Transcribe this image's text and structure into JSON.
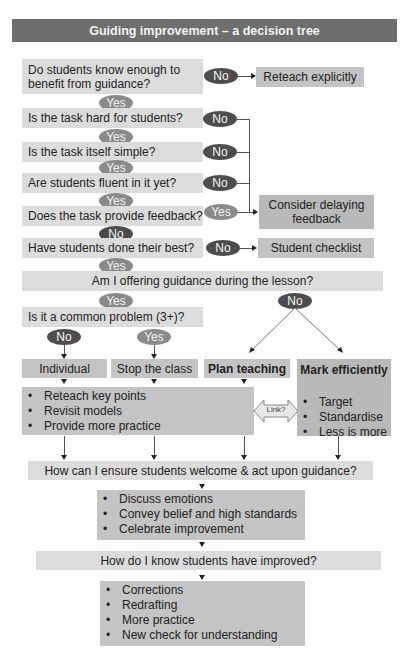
{
  "title": "Guiding improvement – a decision tree",
  "colors": {
    "title_bg": "#6e6e6e",
    "question_bg": "#dcdcdc",
    "action_bg": "#c4c4c4",
    "yes_pill": "#8a8a8a",
    "no_pill": "#4d4d4d"
  },
  "questions": {
    "q1": "Do students know enough to benefit from guidance?",
    "q2": "Is the task hard for students?",
    "q3": "Is the task itself simple?",
    "q4": "Are students fluent in it yet?",
    "q5": "Does the task provide feedback?",
    "q6": "Have students done their best?",
    "q7": "Am I offering guidance during the lesson?",
    "q8": "Is it a common problem (3+)?",
    "q9": "How can I ensure students welcome & act upon guidance?",
    "q10": "How do I know students have improved?"
  },
  "labels": {
    "yes": "Yes",
    "no": "No",
    "link": "Link?"
  },
  "actions": {
    "reteach_explicitly": "Reteach explicitly",
    "consider_delaying": "Consider delaying feedback",
    "student_checklist": "Student checklist",
    "individual": "Individual",
    "stop_the_class": "Stop the class",
    "plan_teaching": "Plan teaching",
    "mark_efficiently": "Mark efficiently"
  },
  "reteach_list": [
    "Reteach key points",
    "Revisit models",
    "Provide more practice"
  ],
  "mark_list": [
    "Target",
    "Standardise",
    "Less is more"
  ],
  "welcome_list": [
    "Discuss emotions",
    "Convey belief and high standards",
    "Celebrate improvement"
  ],
  "improved_list": [
    "Corrections",
    "Redrafting",
    "More practice",
    "New check for understanding"
  ]
}
